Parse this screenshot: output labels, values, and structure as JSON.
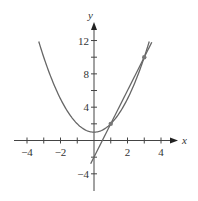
{
  "chart_data": {
    "type": "line",
    "title": "",
    "xlabel": "x",
    "ylabel": "y",
    "xlim": [
      -4.5,
      5
    ],
    "ylim": [
      -6,
      14
    ],
    "grid": false,
    "x_ticks": [
      -4,
      -3,
      -2,
      -1,
      1,
      2,
      3,
      4
    ],
    "x_tick_labels": [
      "-4",
      "-2",
      "2",
      "4"
    ],
    "x_tick_label_values": [
      -4,
      -2,
      2,
      4
    ],
    "y_ticks": [
      -4,
      -2,
      2,
      4,
      6,
      8,
      10,
      12
    ],
    "y_tick_labels": [
      "-4",
      "4",
      "8",
      "12"
    ],
    "y_tick_label_values": [
      -4,
      4,
      8,
      12
    ],
    "series": [
      {
        "name": "parabola",
        "equation": "y = x^2 + 1",
        "x_range": [
          -3.3,
          3.3
        ],
        "color": "#666666"
      },
      {
        "name": "secant line",
        "equation": "y = 4x - 2",
        "x_range": [
          -0.2,
          3.45
        ],
        "color": "#666666"
      }
    ],
    "points": [
      {
        "x": 1,
        "y": 2
      },
      {
        "x": 3,
        "y": 10
      }
    ]
  },
  "labels": {
    "x_axis": "x",
    "y_axis": "y"
  }
}
